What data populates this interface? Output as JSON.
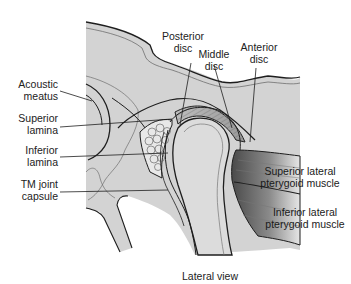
{
  "figure": {
    "caption": "Lateral view",
    "colors": {
      "bone_fill": "#d3d3d3",
      "outline": "#1e1e1e",
      "muscle_dark": "#5a5a5a",
      "background": "#ffffff"
    }
  },
  "labels": {
    "acoustic_meatus": {
      "line1": "Acoustic",
      "line2": "meatus"
    },
    "superior_lamina": {
      "line1": "Superior",
      "line2": "lamina"
    },
    "inferior_lamina": {
      "line1": "Inferior",
      "line2": "lamina"
    },
    "tm_joint_capsule": {
      "line1": "TM joint",
      "line2": "capsule"
    },
    "posterior_disc": {
      "line1": "Posterior",
      "line2": "disc"
    },
    "middle_disc": {
      "line1": "Middle",
      "line2": "disc"
    },
    "anterior_disc": {
      "line1": "Anterior",
      "line2": "disc"
    },
    "superior_lateral_pterygoid": {
      "line1": "Superior lateral",
      "line2": "pterygoid muscle"
    },
    "inferior_lateral_pterygoid": {
      "line1": "Inferior lateral",
      "line2": "pterygoid muscle"
    }
  }
}
